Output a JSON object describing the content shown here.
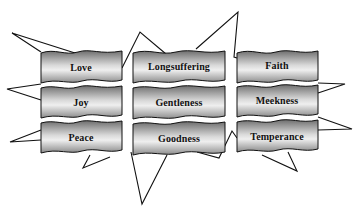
{
  "diagram": {
    "title": "",
    "colors": {
      "banner_light": "#f2f2f2",
      "banner_dark": "#7a7a7a",
      "outline": "#111111",
      "background": "#ffffff"
    },
    "columns": [
      {
        "items": [
          {
            "label": "Love"
          },
          {
            "label": "Joy"
          },
          {
            "label": "Peace"
          }
        ]
      },
      {
        "items": [
          {
            "label": "Longsuffering"
          },
          {
            "label": "Gentleness"
          },
          {
            "label": "Goodness"
          }
        ]
      },
      {
        "items": [
          {
            "label": "Faith"
          },
          {
            "label": "Meekness"
          },
          {
            "label": "Temperance"
          }
        ]
      }
    ]
  }
}
